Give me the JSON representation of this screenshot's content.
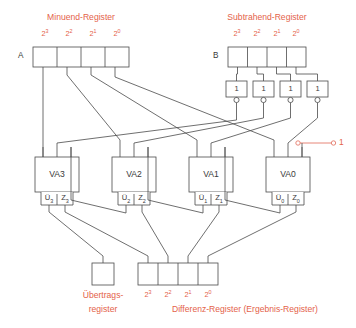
{
  "diagram": {
    "title_minuend": "Minuend-Register",
    "title_subtrahend": "Subtrahend-Register",
    "label_a": "A",
    "label_b": "B",
    "carry_in_value": "1",
    "accent_color": "#e4624a",
    "wire_color": "#4a4a4a",
    "bit_weights": [
      "2³",
      "2²",
      "2¹",
      "2⁰"
    ],
    "minuend_bits": [
      {
        "exp_base": "2",
        "exp_sup": "3"
      },
      {
        "exp_base": "2",
        "exp_sup": "2"
      },
      {
        "exp_base": "2",
        "exp_sup": "1"
      },
      {
        "exp_base": "2",
        "exp_sup": "0"
      }
    ],
    "subtrahend_bits": [
      {
        "exp_base": "2",
        "exp_sup": "3"
      },
      {
        "exp_base": "2",
        "exp_sup": "2"
      },
      {
        "exp_base": "2",
        "exp_sup": "1"
      },
      {
        "exp_base": "2",
        "exp_sup": "0"
      }
    ],
    "difference_bits": [
      {
        "exp_base": "2",
        "exp_sup": "3"
      },
      {
        "exp_base": "2",
        "exp_sup": "2"
      },
      {
        "exp_base": "2",
        "exp_sup": "1"
      },
      {
        "exp_base": "2",
        "exp_sup": "0"
      }
    ],
    "inverters": [
      {
        "label": "1"
      },
      {
        "label": "1"
      },
      {
        "label": "1"
      },
      {
        "label": "1"
      }
    ],
    "adders": [
      {
        "name": "VA3",
        "carry_base": "Ü",
        "carry_sub": "3",
        "sum_base": "Z",
        "sum_sub": "3"
      },
      {
        "name": "VA2",
        "carry_base": "Ü",
        "carry_sub": "2",
        "sum_base": "Z",
        "sum_sub": "2"
      },
      {
        "name": "VA1",
        "carry_base": "Ü",
        "carry_sub": "1",
        "sum_base": "Z",
        "sum_sub": "1"
      },
      {
        "name": "VA0",
        "carry_base": "Ü",
        "carry_sub": "0",
        "sum_base": "Z",
        "sum_sub": "0"
      }
    ],
    "carry_register_line1": "Übertrags-",
    "carry_register_line2": "register",
    "difference_register_caption": "Differenz-Register (Ergebnis-Register)"
  }
}
